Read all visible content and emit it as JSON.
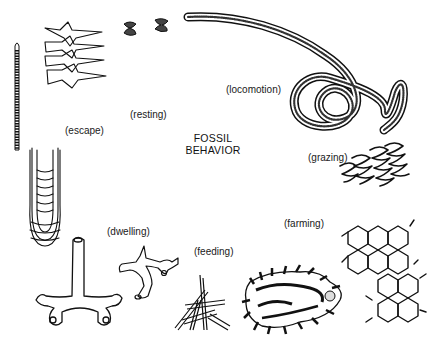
{
  "diagram": {
    "title_line1": "FOSSIL",
    "title_line2": "BEHAVIOR",
    "ink_color": "#111111",
    "background_color": "#ffffff",
    "labels": {
      "resting": "(resting)",
      "locomotion": "(locomotion)",
      "escape": "(escape)",
      "grazing": "(grazing)",
      "dwelling": "(dwelling)",
      "feeding": "(feeding)",
      "farming": "(farming)"
    },
    "figures": [
      {
        "id": "resting",
        "depiction": "star-shaped resting traces and small bilobed impressions"
      },
      {
        "id": "locomotion",
        "depiction": "long curving spiraling trackway"
      },
      {
        "id": "escape",
        "depiction": "vertical segmented burrow and U-shaped spreite burrow"
      },
      {
        "id": "grazing",
        "depiction": "meandering zig-zag trail"
      },
      {
        "id": "dwelling",
        "depiction": "branching burrow systems with openings"
      },
      {
        "id": "feeding",
        "depiction": "branching stick-like feeding burrow"
      },
      {
        "id": "farming",
        "depiction": "hexagonal network and complex branching pattern"
      }
    ]
  }
}
